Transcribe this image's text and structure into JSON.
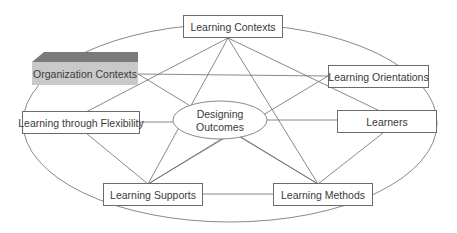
{
  "diagram": {
    "center": {
      "line1": "Designing",
      "line2": "Outcomes"
    },
    "nodes": {
      "learning_contexts": "Learning Contexts",
      "organization_contexts": "Organization Contexts",
      "learning_orientations": "Learning Orientations",
      "learning_through_flexibility": "Learning through Flexibility",
      "learners": "Learners",
      "learning_supports": "Learning Supports",
      "learning_methods": "Learning Methods"
    },
    "colors": {
      "line": "#6b6b6b",
      "org_box": "#c9c9c9",
      "org_top": "#7a7a7a",
      "text": "#3a3a3a"
    }
  }
}
